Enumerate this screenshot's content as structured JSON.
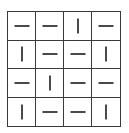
{
  "game": {
    "name": "line-orientation-grid",
    "rows": 4,
    "cols": 4,
    "colors": {
      "grid_line": "#3a3a3a",
      "segment": "#4a4a4a",
      "background": "#ffffff"
    },
    "cells": [
      [
        "horizontal",
        "horizontal",
        "vertical",
        "horizontal"
      ],
      [
        "vertical",
        "horizontal",
        "horizontal",
        "vertical"
      ],
      [
        "horizontal",
        "vertical",
        "horizontal",
        "horizontal"
      ],
      [
        "vertical",
        "horizontal",
        "horizontal",
        "vertical"
      ]
    ]
  }
}
